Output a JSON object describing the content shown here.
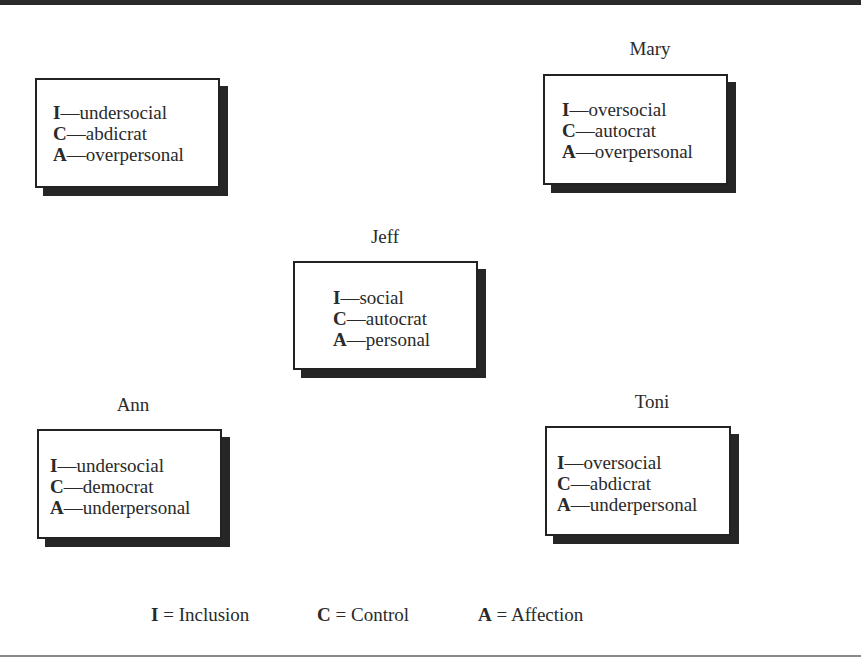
{
  "figure": {
    "dash": "—",
    "equals": " = "
  },
  "people": [
    {
      "name": "Tom",
      "traits": [
        {
          "letter": "I",
          "value": "undersocial"
        },
        {
          "letter": "C",
          "value": "abdicrat"
        },
        {
          "letter": "A",
          "value": "overpersonal"
        }
      ]
    },
    {
      "name": "Mary",
      "traits": [
        {
          "letter": "I",
          "value": "oversocial"
        },
        {
          "letter": "C",
          "value": "autocrat"
        },
        {
          "letter": "A",
          "value": "overpersonal"
        }
      ]
    },
    {
      "name": "Jeff",
      "traits": [
        {
          "letter": "I",
          "value": "social"
        },
        {
          "letter": "C",
          "value": "autocrat"
        },
        {
          "letter": "A",
          "value": "personal"
        }
      ]
    },
    {
      "name": "Ann",
      "traits": [
        {
          "letter": "I",
          "value": "undersocial"
        },
        {
          "letter": "C",
          "value": "democrat"
        },
        {
          "letter": "A",
          "value": "underpersonal"
        }
      ]
    },
    {
      "name": "Toni",
      "traits": [
        {
          "letter": "I",
          "value": "oversocial"
        },
        {
          "letter": "C",
          "value": "abdicrat"
        },
        {
          "letter": "A",
          "value": "underpersonal"
        }
      ]
    }
  ],
  "legend": [
    {
      "letter": "I",
      "meaning": "Inclusion"
    },
    {
      "letter": "C",
      "meaning": "Control"
    },
    {
      "letter": "A",
      "meaning": "Affection"
    }
  ]
}
